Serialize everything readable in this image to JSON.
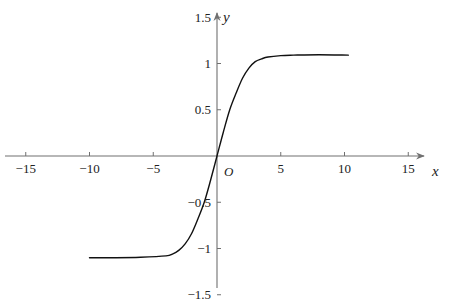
{
  "chart_data": {
    "type": "line",
    "title": "",
    "xlabel": "x",
    "ylabel": "y",
    "origin_label": "O",
    "xlim": [
      -16.5,
      16.5
    ],
    "ylim": [
      -1.7,
      1.85
    ],
    "grid": false,
    "legend": null,
    "x_ticks": [
      -15,
      -10,
      -5,
      5,
      10,
      15
    ],
    "x_tick_labels": [
      "−15",
      "−10",
      "−5",
      "5",
      "10",
      "15"
    ],
    "y_ticks": [
      1.5,
      1,
      0.5,
      -0.5,
      -1,
      -1.5
    ],
    "y_tick_labels": [
      "1.5",
      "1",
      "0.5",
      "−0.5",
      "−1",
      "−1.5"
    ],
    "series": [
      {
        "name": "curve",
        "color": "#111111",
        "x": [
          -10,
          -8,
          -6,
          -4,
          -3.5,
          -3,
          -2.5,
          -2,
          -1.5,
          -1,
          -0.5,
          0,
          0.5,
          1,
          1.5,
          2,
          2.5,
          3,
          3.5,
          4,
          5,
          6,
          8,
          10.3
        ],
        "y": [
          -1.1,
          -1.1,
          -1.095,
          -1.08,
          -1.06,
          -1.02,
          -0.95,
          -0.84,
          -0.68,
          -0.5,
          -0.26,
          0,
          0.26,
          0.5,
          0.68,
          0.84,
          0.95,
          1.02,
          1.05,
          1.07,
          1.085,
          1.09,
          1.095,
          1.09
        ]
      }
    ]
  },
  "colors": {
    "axis": "#707070",
    "curve": "#111111",
    "text": "#222222"
  }
}
